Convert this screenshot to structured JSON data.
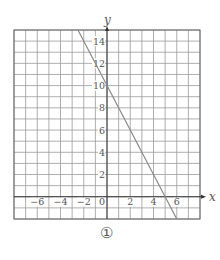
{
  "chart_data": {
    "type": "line",
    "title": "",
    "xlabel": "x",
    "ylabel": "y",
    "xlim": [
      -8,
      8
    ],
    "ylim": [
      -2,
      15
    ],
    "grid": true,
    "x_ticks": [
      -6,
      -4,
      -2,
      0,
      2,
      4,
      6
    ],
    "x_tick_labels": [
      "−6",
      "−4",
      "−2",
      "0",
      "2",
      "4",
      "6"
    ],
    "y_ticks": [
      2,
      4,
      6,
      8,
      10,
      12,
      14
    ],
    "y_tick_labels": [
      "2",
      "4",
      "6",
      "8",
      "10",
      "12",
      "14"
    ],
    "series": [
      {
        "name": "y = -2x + 10",
        "x": [
          -2.5,
          0,
          5,
          6
        ],
        "y": [
          15,
          10,
          0,
          -2
        ],
        "color": "#8a8a8a"
      }
    ],
    "legend": null,
    "annotations": []
  },
  "caption": "①",
  "colors": {
    "grid": "#9a9a9a",
    "axis": "#333333",
    "line": "#8a8a8a",
    "text": "#555555"
  }
}
